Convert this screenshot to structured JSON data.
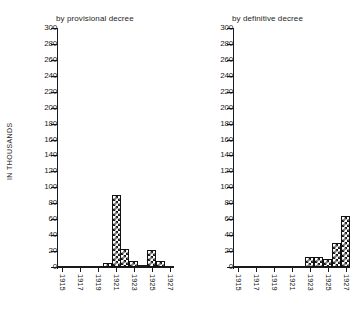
{
  "figure": {
    "axis_caption": "IN THOUSANDS",
    "y_ticks": [
      "300",
      "280",
      "260",
      "240",
      "220",
      "200",
      "180",
      "160",
      "140",
      "120",
      "100",
      "80",
      "60",
      "40",
      "20",
      "0"
    ],
    "x_ticks": [
      "1915",
      "1917",
      "1919",
      "1921",
      "1923",
      "1925",
      "1927"
    ]
  },
  "chart_data": [
    {
      "type": "bar",
      "title": "by provisional decree",
      "xlabel": "",
      "ylabel": "IN THOUSANDS",
      "ylim": [
        0,
        300
      ],
      "ytick_step": 20,
      "grid": false,
      "legend": "none",
      "xtick_labels": [
        "1915",
        "1917",
        "1919",
        "1921",
        "1923",
        "1925",
        "1927"
      ],
      "categories": [
        "1915",
        "1916",
        "1917",
        "1918",
        "1919",
        "1920",
        "1921",
        "1922",
        "1923",
        "1924",
        "1925",
        "1926",
        "1927"
      ],
      "values": [
        0.3,
        0.3,
        0.4,
        0.4,
        0.5,
        5,
        90,
        22,
        8,
        3,
        21,
        7,
        0.5
      ]
    },
    {
      "type": "bar",
      "title": "by definitive decree",
      "xlabel": "",
      "ylabel": "IN THOUSANDS",
      "ylim": [
        0,
        300
      ],
      "ytick_step": 20,
      "grid": false,
      "legend": "none",
      "xtick_labels": [
        "1915",
        "1917",
        "1919",
        "1921",
        "1923",
        "1925",
        "1927"
      ],
      "categories": [
        "1915",
        "1916",
        "1917",
        "1918",
        "1919",
        "1920",
        "1921",
        "1922",
        "1923",
        "1924",
        "1925",
        "1926",
        "1927"
      ],
      "values": [
        0.3,
        0.3,
        0.4,
        0.4,
        0.5,
        0.6,
        0.8,
        1.5,
        12,
        13,
        10,
        30,
        64
      ]
    }
  ]
}
